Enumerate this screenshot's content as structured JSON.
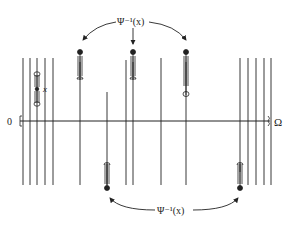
{
  "diagram": {
    "top_label": "Ψ⁻¹(x)",
    "bottom_label": "Ψ⁻¹(x)",
    "point_label": "x",
    "origin_label": "0",
    "axis_label": "Ω",
    "colors": {
      "ink": "#222222",
      "background": "#ffffff"
    },
    "axis_y": 121,
    "left_cluster_x": [
      23,
      30,
      37,
      45,
      53
    ],
    "middle_lines_x": [
      80,
      107,
      130,
      161,
      186
    ],
    "right_cluster_x": [
      240,
      248,
      256,
      264,
      271
    ],
    "fibers": [
      {
        "id": "x-point",
        "x": 37,
        "y_top": 72,
        "y_bottom": 102,
        "type": "source"
      },
      {
        "id": "upper-1",
        "x": 80,
        "y_top": 52,
        "type": "up"
      },
      {
        "id": "upper-2",
        "x": 133,
        "y_top": 52,
        "type": "up"
      },
      {
        "id": "upper-3",
        "x": 186,
        "y_top": 52,
        "type": "up"
      },
      {
        "id": "lower-1",
        "x": 107,
        "y_bottom": 188,
        "type": "down"
      },
      {
        "id": "lower-2",
        "x": 240,
        "y_bottom": 188,
        "type": "down"
      }
    ]
  }
}
